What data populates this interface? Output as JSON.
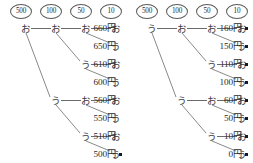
{
  "diagram": {
    "panels": [
      {
        "id": "left",
        "denominations": [
          "500",
          "100",
          "50",
          "10"
        ],
        "rows": [
          {
            "nodes": [
              "お",
              "お",
              "お",
              "お"
            ],
            "start_col": 0,
            "amount": "660円",
            "bullet": false
          },
          {
            "nodes": [
              "う"
            ],
            "start_col": 3,
            "amount": "650円",
            "bullet": false
          },
          {
            "nodes": [
              "う",
              "お"
            ],
            "start_col": 2,
            "amount": "610円",
            "bullet": false
          },
          {
            "nodes": [
              "う"
            ],
            "start_col": 3,
            "amount": "600円",
            "bullet": false
          },
          {
            "nodes": [
              "う",
              "お",
              "お"
            ],
            "start_col": 1,
            "amount": "560円",
            "bullet": false
          },
          {
            "nodes": [
              "う"
            ],
            "start_col": 3,
            "amount": "550円",
            "bullet": false
          },
          {
            "nodes": [
              "う",
              "お"
            ],
            "start_col": 2,
            "amount": "510円",
            "bullet": false
          },
          {
            "nodes": [
              "う"
            ],
            "start_col": 3,
            "amount": "500円",
            "bullet": true
          }
        ],
        "branches": [
          {
            "from_col": 0,
            "from_row": 0,
            "to_col": 1,
            "to_row": 4
          },
          {
            "from_col": 1,
            "from_row": 0,
            "to_col": 2,
            "to_row": 2
          },
          {
            "from_col": 2,
            "from_row": 0,
            "to_col": 3,
            "to_row": 1
          },
          {
            "from_col": 2,
            "from_row": 2,
            "to_col": 3,
            "to_row": 3
          },
          {
            "from_col": 1,
            "from_row": 4,
            "to_col": 2,
            "to_row": 6
          },
          {
            "from_col": 2,
            "from_row": 4,
            "to_col": 3,
            "to_row": 5
          },
          {
            "from_col": 2,
            "from_row": 6,
            "to_col": 3,
            "to_row": 7
          }
        ]
      },
      {
        "id": "right",
        "denominations": [
          "500",
          "100",
          "50",
          "10"
        ],
        "rows": [
          {
            "nodes": [
              "う",
              "お",
              "お",
              "お"
            ],
            "start_col": 0,
            "amount": "160円",
            "bullet": true
          },
          {
            "nodes": [
              "う"
            ],
            "start_col": 3,
            "amount": "150円",
            "bullet": true
          },
          {
            "nodes": [
              "う",
              "お"
            ],
            "start_col": 2,
            "amount": "110円",
            "bullet": true
          },
          {
            "nodes": [
              "う"
            ],
            "start_col": 3,
            "amount": "100円",
            "bullet": true
          },
          {
            "nodes": [
              "う",
              "お",
              "お"
            ],
            "start_col": 1,
            "amount": "60円",
            "bullet": true
          },
          {
            "nodes": [
              "う"
            ],
            "start_col": 3,
            "amount": "50円",
            "bullet": true
          },
          {
            "nodes": [
              "う",
              "お"
            ],
            "start_col": 2,
            "amount": "10円",
            "bullet": true
          },
          {
            "nodes": [
              "う"
            ],
            "start_col": 3,
            "amount": "0円",
            "bullet": true
          }
        ],
        "branches": [
          {
            "from_col": 0,
            "from_row": 0,
            "to_col": 1,
            "to_row": 4
          },
          {
            "from_col": 1,
            "from_row": 0,
            "to_col": 2,
            "to_row": 2
          },
          {
            "from_col": 2,
            "from_row": 0,
            "to_col": 3,
            "to_row": 1
          },
          {
            "from_col": 2,
            "from_row": 2,
            "to_col": 3,
            "to_row": 3
          },
          {
            "from_col": 1,
            "from_row": 4,
            "to_col": 2,
            "to_row": 6
          },
          {
            "from_col": 2,
            "from_row": 4,
            "to_col": 3,
            "to_row": 5
          },
          {
            "from_col": 2,
            "from_row": 6,
            "to_col": 3,
            "to_row": 7
          }
        ]
      }
    ],
    "layout": {
      "col_x": [
        18,
        48,
        78,
        108
      ],
      "denom_x": [
        10,
        40,
        70,
        100
      ],
      "row_y": [
        21,
        39,
        57,
        75,
        93,
        111,
        129,
        147
      ],
      "amount_x": 60,
      "bullet_x": 119
    },
    "colors": {
      "line": "#6b6b6b",
      "text": "#2b2b2b",
      "glyph": "#3a3a3a",
      "bullet": "#1a1a1a",
      "background": "#ffffff"
    }
  }
}
